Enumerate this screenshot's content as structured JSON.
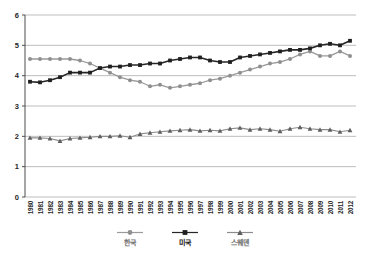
{
  "chart_data": {
    "type": "line",
    "title": "",
    "xlabel": "",
    "ylabel": "",
    "x": [
      "1980",
      "1981",
      "1982",
      "1983",
      "1984",
      "1985",
      "1986",
      "1987",
      "1988",
      "1989",
      "1990",
      "1991",
      "1992",
      "1993",
      "1994",
      "1995",
      "1996",
      "1997",
      "1998",
      "1999",
      "2000",
      "2001",
      "2002",
      "2003",
      "2004",
      "2005",
      "2006",
      "2007",
      "2008",
      "2009",
      "2010",
      "2011",
      "2012"
    ],
    "ylim": [
      0,
      6
    ],
    "yticks": [
      "0",
      "1",
      "2",
      "3",
      "4",
      "5",
      "6"
    ],
    "grid": "horizontal-only",
    "legend_position": "bottom-center",
    "series": [
      {
        "name": "한국",
        "marker": "circle",
        "color": "#8f8f8f",
        "line_color": "#9a9a9a",
        "legend_text_color": "#6e6e6e",
        "values": [
          4.55,
          4.55,
          4.55,
          4.55,
          4.55,
          4.5,
          4.4,
          4.25,
          4.1,
          3.95,
          3.85,
          3.8,
          3.65,
          3.7,
          3.6,
          3.65,
          3.7,
          3.75,
          3.85,
          3.9,
          4.0,
          4.1,
          4.2,
          4.3,
          4.4,
          4.45,
          4.55,
          4.7,
          4.8,
          4.65,
          4.65,
          4.8,
          4.65
        ]
      },
      {
        "name": "미국",
        "marker": "square",
        "color": "#1f1f1f",
        "line_color": "#262626",
        "legend_text_color": "#111111",
        "values": [
          3.8,
          3.78,
          3.85,
          3.95,
          4.1,
          4.1,
          4.1,
          4.25,
          4.3,
          4.3,
          4.35,
          4.35,
          4.4,
          4.4,
          4.5,
          4.55,
          4.6,
          4.6,
          4.5,
          4.45,
          4.45,
          4.6,
          4.65,
          4.7,
          4.75,
          4.8,
          4.85,
          4.85,
          4.9,
          5.0,
          5.05,
          5.0,
          5.15
        ]
      },
      {
        "name": "스웨덴",
        "marker": "triangle",
        "color": "#5e5e5e",
        "line_color": "#8c8c8c",
        "legend_text_color": "#6e6e6e",
        "values": [
          1.95,
          1.95,
          1.93,
          1.85,
          1.93,
          1.95,
          1.97,
          2.0,
          2.0,
          2.02,
          1.97,
          2.08,
          2.12,
          2.15,
          2.18,
          2.2,
          2.22,
          2.18,
          2.2,
          2.18,
          2.25,
          2.28,
          2.22,
          2.25,
          2.22,
          2.17,
          2.25,
          2.3,
          2.25,
          2.22,
          2.22,
          2.15,
          2.2
        ]
      }
    ]
  },
  "colors": {
    "background": "#ffffff",
    "gridline": "#bdbdbd",
    "axis": "#4d4d4d",
    "tick_label": "#262626"
  }
}
